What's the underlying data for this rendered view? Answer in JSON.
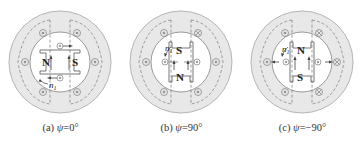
{
  "figure": {
    "panels": [
      {
        "id": "a",
        "caption_prefix": "(a) ",
        "caption_symbol": "ψ",
        "caption_value": "=0°",
        "rotor_pole_top": "",
        "rotor_pole_bottom": "",
        "rotor_pole_left": "N",
        "rotor_pole_right": "S",
        "speed_label": "n",
        "speed_subscript": "1"
      },
      {
        "id": "b",
        "caption_prefix": "(b) ",
        "caption_symbol": "ψ",
        "caption_value": "=90°",
        "rotor_pole_top": "S",
        "rotor_pole_bottom": "N",
        "rotor_pole_left": "",
        "rotor_pole_right": "",
        "speed_label": "n",
        "speed_subscript": "1"
      },
      {
        "id": "c",
        "caption_prefix": "(c) ",
        "caption_symbol": "ψ",
        "caption_value": "=−90°",
        "rotor_pole_top": "N",
        "rotor_pole_bottom": "S",
        "rotor_pole_left": "",
        "rotor_pole_right": "",
        "speed_label": "n",
        "speed_subscript": "1"
      }
    ],
    "colors": {
      "stator_fill": "#e6e6e6",
      "stator_stroke": "#b0b0b0",
      "rotor_bore_fill": "#ffffff",
      "line": "#555555",
      "text": "#222222"
    }
  }
}
